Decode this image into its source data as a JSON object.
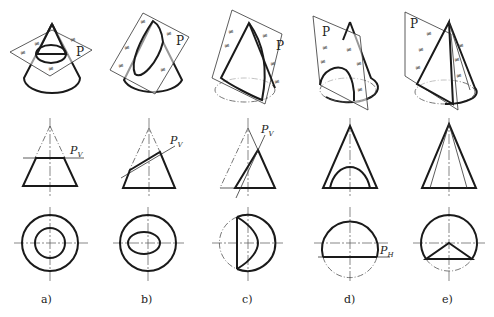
{
  "figure": {
    "columns": [
      {
        "id": "a",
        "label": "a)",
        "plane_label": "P",
        "trace_label": "P",
        "trace_sub": "V",
        "section": "circle (plane perpendicular to axis)"
      },
      {
        "id": "b",
        "label": "b)",
        "plane_label": "P",
        "trace_label": "P",
        "trace_sub": "V",
        "section": "ellipse (plane oblique, cuts all generators)"
      },
      {
        "id": "c",
        "label": "c)",
        "plane_label": "P",
        "trace_label": "P",
        "trace_sub": "V",
        "section": "parabola (plane parallel to one generator)"
      },
      {
        "id": "d",
        "label": "d)",
        "plane_label": "P",
        "trace_label": "P",
        "trace_sub": "H",
        "section": "hyperbola (plane parallel to axis)"
      },
      {
        "id": "e",
        "label": "e)",
        "plane_label": "P",
        "trace_label": "",
        "trace_sub": "",
        "section": "triangle (plane through apex)"
      }
    ],
    "rows": [
      "pictorial view",
      "front view",
      "top view"
    ]
  }
}
